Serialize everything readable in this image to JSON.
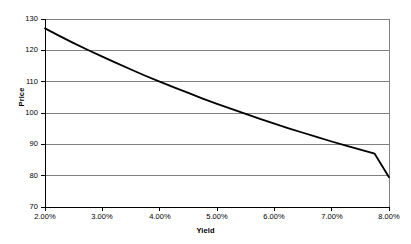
{
  "chart_data": {
    "type": "line",
    "title": "",
    "xlabel": "Yield",
    "ylabel": "Price",
    "xlim": [
      2.0,
      8.0
    ],
    "ylim": [
      70,
      130
    ],
    "grid": "horizontal",
    "legend": "none",
    "x_tick_labels": [
      "2.00%",
      "3.00%",
      "4.00%",
      "5.00%",
      "6.00%",
      "7.00%",
      "8.00%"
    ],
    "x_ticks": [
      2.0,
      3.0,
      4.0,
      5.0,
      6.0,
      7.0,
      8.0
    ],
    "y_tick_labels": [
      "70",
      "80",
      "90",
      "100",
      "110",
      "120",
      "130"
    ],
    "y_ticks": [
      70,
      80,
      90,
      100,
      110,
      120,
      130
    ],
    "series": [
      {
        "name": "Price",
        "color": "#000000",
        "x": [
          2.0,
          2.25,
          2.5,
          2.75,
          3.0,
          3.25,
          3.5,
          3.75,
          4.0,
          4.25,
          4.5,
          4.75,
          5.0,
          5.25,
          5.5,
          5.75,
          6.0,
          6.25,
          6.5,
          6.75,
          7.0,
          7.25,
          7.5,
          7.75,
          8.0
        ],
        "values": [
          127.0,
          124.6,
          122.3,
          120.1,
          118.0,
          115.9,
          113.9,
          111.9,
          110.0,
          108.2,
          106.4,
          104.6,
          102.9,
          101.3,
          99.7,
          98.1,
          96.6,
          95.1,
          93.7,
          92.3,
          90.9,
          89.6,
          88.3,
          87.0,
          79.5
        ]
      }
    ],
    "curve_endpoints": {
      "left": {
        "yield": "2.00%",
        "price": 127.0
      },
      "right": {
        "yield": "8.00%",
        "price": 79.5
      }
    },
    "gridline_crossings": [
      {
        "price": 120,
        "yield": "2.87%"
      },
      {
        "price": 110,
        "yield": "3.88%"
      },
      {
        "price": 100,
        "yield": "5.00%"
      },
      {
        "price": 90,
        "yield": "6.35%"
      },
      {
        "price": 80,
        "yield": "7.97%"
      }
    ],
    "colors": {
      "line": "#000000",
      "grid": "#808080",
      "axis": "#000000",
      "background": "#ffffff"
    }
  }
}
